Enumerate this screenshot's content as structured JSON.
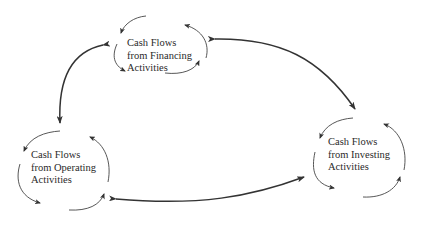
{
  "diagram": {
    "type": "cycle",
    "colors": {
      "stroke": "#333333",
      "text": "#2a2a2a",
      "background": "#ffffff"
    },
    "nodes": [
      {
        "id": "financing",
        "lines": [
          "Cash Flows",
          "from Financing",
          "Activities"
        ]
      },
      {
        "id": "operating",
        "lines": [
          "Cash Flows",
          "from Operating",
          "Activities"
        ]
      },
      {
        "id": "investing",
        "lines": [
          "Cash Flows",
          "from Investing",
          "Activities"
        ]
      }
    ],
    "connections": [
      {
        "from": "financing",
        "to": "investing",
        "bidirectional": true
      },
      {
        "from": "financing",
        "to": "operating",
        "bidirectional": true
      },
      {
        "from": "operating",
        "to": "investing",
        "bidirectional": true
      }
    ]
  }
}
